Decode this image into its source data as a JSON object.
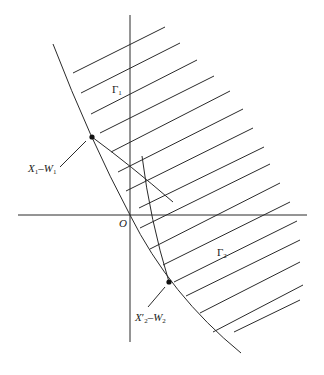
{
  "diagram": {
    "origin_label": "O",
    "regions": [
      {
        "name": "Gamma1",
        "symbol": "Γ",
        "subscript": "1"
      },
      {
        "name": "Gamma2",
        "symbol": "Γ",
        "subscript": "2"
      }
    ],
    "points": [
      {
        "label_main": "X",
        "label_sub": "1",
        "label_dash": "–",
        "label_w": "W",
        "label_wsub": "1"
      },
      {
        "label_main": "X",
        "label_sub": "2",
        "label_prime": "′",
        "label_dash": "–",
        "label_w": "W",
        "label_wsub": "2"
      }
    ],
    "colors": {
      "stroke": "#2a2a2a",
      "background": "#ffffff"
    }
  }
}
